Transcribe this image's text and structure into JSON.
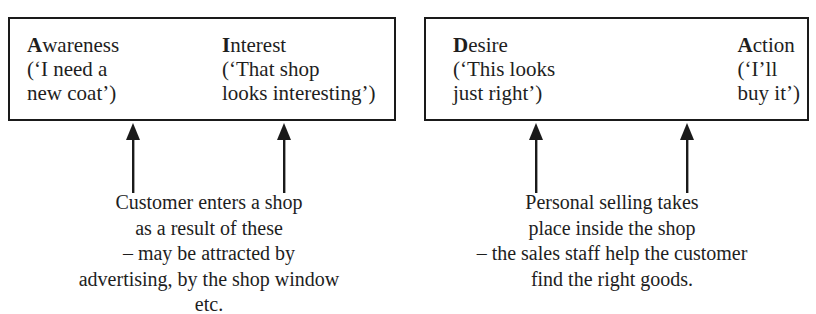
{
  "diagram": {
    "boxes": [
      {
        "stages": [
          {
            "initial": "A",
            "rest": "wareness",
            "lines": [
              "(‘I need a",
              "new coat’)"
            ]
          },
          {
            "initial": "I",
            "rest": "nterest",
            "lines": [
              "(‘That shop",
              "looks interesting’)"
            ]
          }
        ],
        "caption": [
          "Customer enters a shop",
          "as a result of these",
          "– may be attracted by",
          "advertising, by the shop window",
          "etc."
        ]
      },
      {
        "stages": [
          {
            "initial": "D",
            "rest": "esire",
            "lines": [
              "(‘This looks",
              "just right’)"
            ]
          },
          {
            "initial": "A",
            "rest": "ction",
            "lines": [
              "(‘I’ll",
              "buy it’)"
            ]
          }
        ],
        "caption": [
          "Personal selling takes",
          "place inside the shop",
          "– the sales staff help the customer",
          "find the right goods."
        ]
      }
    ],
    "colors": {
      "ink": "#1a1a1a",
      "background": "#ffffff"
    }
  }
}
